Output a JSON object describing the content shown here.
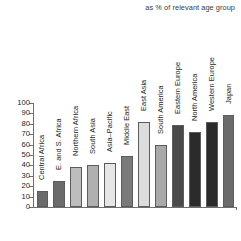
{
  "subtitle": "as % of relevant age group",
  "chart_data": {
    "type": "bar",
    "title": "",
    "subtitle": "as % of relevant age group",
    "xlabel": "",
    "ylabel": "",
    "ylim": [
      0,
      100
    ],
    "yticks": [
      0,
      10,
      20,
      30,
      40,
      50,
      60,
      70,
      80,
      90,
      100
    ],
    "ytick_labels": [
      "0",
      "10",
      "20",
      "30",
      "40",
      "50",
      "60",
      "70",
      "80",
      "90",
      "100"
    ],
    "grid": false,
    "legend": "none",
    "categories": [
      "Central Africa",
      "E. and S. Africa",
      "Northern Africa",
      "South Asia",
      "Asia–Pacific",
      "Middle East",
      "East Asia",
      "South America",
      "Eastern Europe",
      "North America",
      "Western Europe",
      "Japan"
    ],
    "values": [
      15,
      25,
      38,
      40,
      42,
      49,
      82,
      60,
      79,
      72,
      82,
      88
    ],
    "bar_colors": [
      "#6b6b6b",
      "#6b6b6b",
      "#bdbdbd",
      "#b0b0b0",
      "#e6e6e6",
      "#7a7a7a",
      "#dcdcdc",
      "#a9a9a9",
      "#4a4a4a",
      "#2b2b2b",
      "#2b2b2b",
      "#6b6b6b"
    ],
    "axis_color": "#6f6f6f",
    "text_color": "#231f20"
  }
}
